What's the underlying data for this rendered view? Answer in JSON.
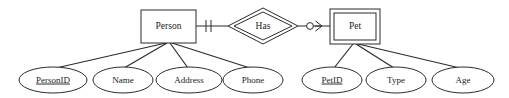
{
  "diagram": {
    "notation": "chen-with-crowsfoot",
    "background_color": "#ffffff",
    "line_color": "#2b2b2b",
    "text_color": "#1a1a1a"
  },
  "entities": [
    {
      "id": "person",
      "label": "Person",
      "type": "strong-entity",
      "border": "single",
      "x": 141,
      "y": 10,
      "w": 55,
      "h": 33
    },
    {
      "id": "pet",
      "label": "Pet",
      "type": "weak-entity",
      "border": "double",
      "x": 330,
      "y": 9,
      "w": 50,
      "h": 35
    }
  ],
  "relationships": [
    {
      "id": "has",
      "label": "Has",
      "type": "identifying-relationship",
      "border": "double",
      "cx": 263,
      "cy": 26,
      "rx": 35,
      "ry": 18
    }
  ],
  "connectors": [
    {
      "id": "person-to-has",
      "from": "person",
      "to": "has",
      "cardinality_marker": "one-and-only-one",
      "marker_description": "two vertical tick marks"
    },
    {
      "id": "has-to-pet",
      "from": "has",
      "to": "pet",
      "cardinality_marker": "zero-or-many",
      "marker_description": "circle followed by crow's foot"
    }
  ],
  "attributes": [
    {
      "id": "person-id",
      "label": "PersonID",
      "owner": "person",
      "key": true,
      "cx": 53,
      "cy": 80,
      "rx": 34,
      "ry": 13
    },
    {
      "id": "name",
      "label": "Name",
      "owner": "person",
      "key": false,
      "cx": 123,
      "cy": 80,
      "rx": 30,
      "ry": 13
    },
    {
      "id": "address",
      "label": "Address",
      "owner": "person",
      "key": false,
      "cx": 189,
      "cy": 80,
      "rx": 33,
      "ry": 13
    },
    {
      "id": "phone",
      "label": "Phone",
      "owner": "person",
      "key": false,
      "cx": 253,
      "cy": 80,
      "rx": 30,
      "ry": 13
    },
    {
      "id": "pet-id",
      "label": "PetID",
      "owner": "pet",
      "key": true,
      "cx": 332,
      "cy": 80,
      "rx": 30,
      "ry": 13
    },
    {
      "id": "type",
      "label": "Type",
      "owner": "pet",
      "key": false,
      "cx": 396,
      "cy": 80,
      "rx": 30,
      "ry": 13
    },
    {
      "id": "age",
      "label": "Age",
      "owner": "pet",
      "key": false,
      "cx": 463,
      "cy": 80,
      "rx": 31,
      "ry": 13
    }
  ]
}
